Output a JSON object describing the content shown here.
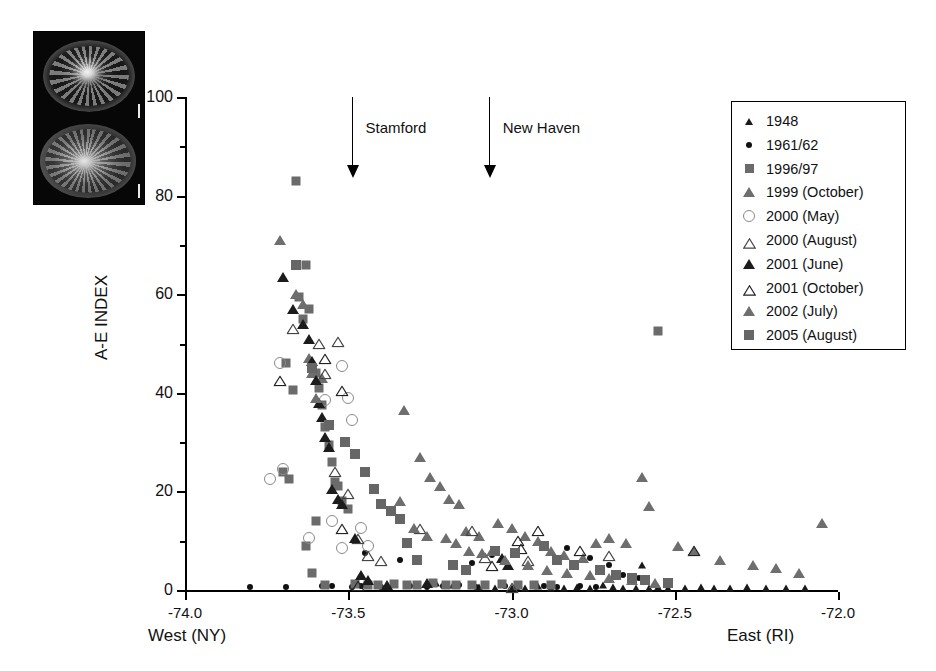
{
  "figure": {
    "photo_inset": {
      "name": "micrograph-inset",
      "panels": [
        "otolith-section-top",
        "otolith-section-bottom"
      ]
    }
  },
  "chart_data": {
    "type": "scatter",
    "title": "",
    "xlabel": "",
    "ylabel": "A-E INDEX",
    "xlim": [
      -74.0,
      -72.0
    ],
    "ylim": [
      0,
      100
    ],
    "grid": false,
    "legend_position": "top-right",
    "xticks": [
      "-74.0",
      "-73.5",
      "-73.0",
      "-72.5",
      "-72.0"
    ],
    "xtick_values": [
      -74.0,
      -73.5,
      -73.0,
      -72.5,
      -72.0
    ],
    "yticks": [
      "0",
      "20",
      "40",
      "60",
      "80",
      "100"
    ],
    "ytick_values": [
      0,
      20,
      40,
      60,
      80,
      100
    ],
    "yminor_values": [
      10,
      30,
      50,
      70,
      90
    ],
    "axis_end_labels": {
      "left": "West (NY)",
      "right": "East (RI)"
    },
    "annotations": [
      {
        "label": "Stamford",
        "x": -73.49,
        "y_top": 100,
        "y_tip": 84
      },
      {
        "label": "New Haven",
        "x": -73.07,
        "y_top": 100,
        "y_tip": 84
      }
    ],
    "series": [
      {
        "name": "1948",
        "marker": "triangle-filled-small",
        "color": "#1a1a1a",
        "points": [
          [
            -73.1,
            0.6
          ],
          [
            -73.05,
            0.5
          ],
          [
            -73.0,
            0.4
          ],
          [
            -72.96,
            0.5
          ],
          [
            -72.92,
            0.8
          ],
          [
            -72.88,
            0.5
          ],
          [
            -72.84,
            0.4
          ],
          [
            -72.8,
            0.6
          ],
          [
            -72.76,
            0.5
          ],
          [
            -72.72,
            1.0
          ],
          [
            -72.69,
            0.6
          ],
          [
            -72.66,
            0.5
          ],
          [
            -72.62,
            0.4
          ],
          [
            -72.58,
            0.5
          ],
          [
            -72.55,
            0.6
          ],
          [
            -72.52,
            0.4
          ],
          [
            -72.47,
            0.5
          ],
          [
            -72.42,
            0.6
          ],
          [
            -72.38,
            0.4
          ],
          [
            -72.33,
            0.5
          ],
          [
            -72.28,
            0.6
          ],
          [
            -72.22,
            0.5
          ],
          [
            -72.16,
            0.4
          ],
          [
            -72.1,
            0.5
          ],
          [
            -72.6,
            5.0
          ],
          [
            -73.23,
            1.5
          ],
          [
            -73.18,
            1.0
          ],
          [
            -72.05,
            13.5
          ]
        ]
      },
      {
        "name": "1961/62",
        "marker": "circle-filled",
        "color": "#111111",
        "points": [
          [
            -73.8,
            0.7
          ],
          [
            -73.69,
            0.7
          ],
          [
            -73.58,
            0.8
          ],
          [
            -73.55,
            0.8
          ],
          [
            -73.49,
            0.7
          ],
          [
            -73.4,
            0.7
          ],
          [
            -73.31,
            0.8
          ],
          [
            -73.26,
            0.7
          ],
          [
            -73.21,
            0.8
          ],
          [
            -73.16,
            1.0
          ],
          [
            -73.11,
            0.7
          ],
          [
            -73.02,
            0.8
          ],
          [
            -72.98,
            0.7
          ],
          [
            -72.9,
            0.8
          ],
          [
            -72.86,
            0.7
          ],
          [
            -72.79,
            0.8
          ],
          [
            -72.74,
            0.7
          ],
          [
            -73.34,
            6.0
          ],
          [
            -73.12,
            5.5
          ],
          [
            -73.06,
            7.0
          ],
          [
            -72.83,
            8.5
          ],
          [
            -72.76,
            6.5
          ],
          [
            -72.7,
            5.0
          ],
          [
            -72.66,
            3.0
          ],
          [
            -72.61,
            2.5
          ],
          [
            -73.45,
            7.5
          ],
          [
            -73.46,
            0.8
          ]
        ]
      },
      {
        "name": "1996/97",
        "marker": "square-filled",
        "color": "#6b6b6b",
        "points": [
          [
            -73.66,
            83.0
          ],
          [
            -73.63,
            66.0
          ],
          [
            -73.65,
            59.5
          ],
          [
            -73.64,
            55.0
          ],
          [
            -73.67,
            40.5
          ],
          [
            -73.62,
            57.0
          ],
          [
            -73.69,
            46.0
          ],
          [
            -73.6,
            44.0
          ],
          [
            -73.59,
            41.0
          ],
          [
            -73.58,
            37.5
          ],
          [
            -73.57,
            33.0
          ],
          [
            -73.56,
            29.5
          ],
          [
            -73.55,
            26.0
          ],
          [
            -73.54,
            22.0
          ],
          [
            -73.53,
            21.0
          ],
          [
            -73.52,
            18.0
          ],
          [
            -73.5,
            16.5
          ],
          [
            -73.6,
            14.0
          ],
          [
            -73.68,
            22.5
          ],
          [
            -73.7,
            24.0
          ],
          [
            -73.63,
            9.0
          ],
          [
            -73.61,
            3.5
          ],
          [
            -73.57,
            1.0
          ],
          [
            -73.48,
            1.2
          ],
          [
            -73.44,
            1.0
          ],
          [
            -73.41,
            1.0
          ],
          [
            -73.36,
            1.2
          ],
          [
            -73.32,
            1.0
          ],
          [
            -73.29,
            1.0
          ],
          [
            -73.24,
            1.5
          ],
          [
            -73.2,
            1.0
          ],
          [
            -73.17,
            1.0
          ],
          [
            -73.12,
            1.0
          ],
          [
            -73.08,
            1.0
          ],
          [
            -73.03,
            1.2
          ],
          [
            -72.98,
            1.0
          ],
          [
            -72.93,
            1.0
          ],
          [
            -72.88,
            1.0
          ],
          [
            -72.55,
            52.5
          ]
        ]
      },
      {
        "name": "1999 (October)",
        "marker": "triangle-filled",
        "color": "#6e6e6e",
        "points": [
          [
            -73.71,
            71.0
          ],
          [
            -73.66,
            60.0
          ],
          [
            -73.64,
            58.0
          ],
          [
            -73.62,
            47.0
          ],
          [
            -73.61,
            44.0
          ],
          [
            -73.58,
            43.0
          ],
          [
            -73.33,
            36.5
          ],
          [
            -73.28,
            27.0
          ],
          [
            -73.25,
            23.0
          ],
          [
            -73.22,
            21.0
          ],
          [
            -73.19,
            18.5
          ],
          [
            -73.16,
            17.5
          ],
          [
            -73.14,
            12.0
          ],
          [
            -73.1,
            11.0
          ],
          [
            -73.04,
            13.5
          ],
          [
            -73.0,
            12.5
          ],
          [
            -72.96,
            11.0
          ],
          [
            -72.92,
            10.0
          ],
          [
            -72.88,
            8.0
          ],
          [
            -72.84,
            7.0
          ],
          [
            -72.78,
            6.5
          ],
          [
            -72.74,
            9.5
          ],
          [
            -72.7,
            10.5
          ],
          [
            -72.6,
            23.0
          ],
          [
            -72.58,
            17.0
          ],
          [
            -72.49,
            9.0
          ],
          [
            -72.44,
            8.0
          ],
          [
            -72.36,
            6.0
          ],
          [
            -72.26,
            5.0
          ],
          [
            -72.19,
            4.5
          ],
          [
            -72.12,
            3.5
          ],
          [
            -72.05,
            13.5
          ],
          [
            -72.65,
            9.5
          ],
          [
            -73.06,
            8.0
          ]
        ]
      },
      {
        "name": "2000 (May)",
        "marker": "circle-open",
        "color": "#8a8a8a",
        "points": [
          [
            -73.71,
            46.0
          ],
          [
            -73.74,
            22.5
          ],
          [
            -73.7,
            24.5
          ],
          [
            -73.52,
            45.5
          ],
          [
            -73.5,
            39.0
          ],
          [
            -73.49,
            34.5
          ],
          [
            -73.57,
            38.5
          ],
          [
            -73.62,
            10.5
          ],
          [
            -73.55,
            14.0
          ],
          [
            -73.52,
            8.5
          ],
          [
            -73.46,
            12.5
          ],
          [
            -73.44,
            9.0
          ]
        ]
      },
      {
        "name": "2000 (August)",
        "marker": "triangle-open",
        "color": "#444444",
        "points": [
          [
            -73.67,
            53.5
          ],
          [
            -73.59,
            50.5
          ],
          [
            -73.53,
            51.0
          ],
          [
            -73.57,
            44.5
          ],
          [
            -73.54,
            24.5
          ],
          [
            -73.5,
            20.0
          ],
          [
            -73.47,
            11.0
          ],
          [
            -73.44,
            7.5
          ],
          [
            -73.4,
            6.5
          ],
          [
            -73.28,
            13.0
          ],
          [
            -73.12,
            12.5
          ],
          [
            -73.08,
            7.0
          ],
          [
            -73.0,
            1.0
          ],
          [
            -72.95,
            6.5
          ],
          [
            -72.7,
            7.5
          ]
        ]
      },
      {
        "name": "2001 (June)",
        "marker": "triangle-filled-dark",
        "color": "#1c1c1c",
        "points": [
          [
            -73.7,
            63.5
          ],
          [
            -73.67,
            57.0
          ],
          [
            -73.64,
            54.0
          ],
          [
            -73.62,
            51.0
          ],
          [
            -73.61,
            46.5
          ],
          [
            -73.6,
            42.5
          ],
          [
            -73.59,
            38.0
          ],
          [
            -73.58,
            35.0
          ],
          [
            -73.57,
            31.0
          ],
          [
            -73.56,
            29.0
          ],
          [
            -73.55,
            20.5
          ],
          [
            -73.53,
            18.5
          ],
          [
            -73.52,
            17.5
          ],
          [
            -73.48,
            10.5
          ],
          [
            -73.46,
            3.0
          ],
          [
            -73.44,
            2.0
          ],
          [
            -73.38,
            1.0
          ],
          [
            -73.26,
            1.5
          ],
          [
            -73.03,
            6.5
          ],
          [
            -73.01,
            5.0
          ]
        ]
      },
      {
        "name": "2001 (October)",
        "marker": "triangle-open-dark",
        "color": "#222222",
        "points": [
          [
            -73.71,
            43.0
          ],
          [
            -73.57,
            47.5
          ],
          [
            -73.52,
            41.0
          ],
          [
            -73.52,
            13.0
          ],
          [
            -73.47,
            1.5
          ],
          [
            -73.06,
            5.5
          ],
          [
            -72.98,
            10.5
          ],
          [
            -72.97,
            9.0
          ],
          [
            -72.92,
            12.5
          ],
          [
            -72.79,
            8.5
          ],
          [
            -72.44,
            8.5
          ]
        ]
      },
      {
        "name": "2002 (July)",
        "marker": "triangle-filled-med",
        "color": "#6e6e6e",
        "points": [
          [
            -73.6,
            39.0
          ],
          [
            -73.34,
            18.0
          ],
          [
            -73.3,
            12.5
          ],
          [
            -73.26,
            11.0
          ],
          [
            -73.2,
            10.5
          ],
          [
            -73.17,
            9.5
          ],
          [
            -73.13,
            8.0
          ],
          [
            -73.09,
            7.5
          ],
          [
            -73.02,
            6.0
          ],
          [
            -72.95,
            5.0
          ],
          [
            -72.89,
            4.0
          ],
          [
            -72.83,
            3.5
          ],
          [
            -72.76,
            3.0
          ],
          [
            -72.7,
            2.5
          ],
          [
            -72.63,
            2.0
          ],
          [
            -72.56,
            1.5
          ]
        ]
      },
      {
        "name": "2005 (August)",
        "marker": "square-filled-large",
        "color": "#666666",
        "points": [
          [
            -73.66,
            66.0
          ],
          [
            -73.61,
            45.0
          ],
          [
            -73.56,
            33.5
          ],
          [
            -73.51,
            30.0
          ],
          [
            -73.48,
            27.5
          ],
          [
            -73.45,
            24.0
          ],
          [
            -73.42,
            20.5
          ],
          [
            -73.4,
            17.5
          ],
          [
            -73.37,
            16.0
          ],
          [
            -73.34,
            14.5
          ],
          [
            -73.32,
            9.5
          ],
          [
            -73.29,
            6.0
          ],
          [
            -73.18,
            5.0
          ],
          [
            -73.14,
            4.0
          ],
          [
            -73.05,
            8.0
          ],
          [
            -72.99,
            7.5
          ],
          [
            -72.9,
            9.0
          ],
          [
            -72.86,
            6.0
          ],
          [
            -72.81,
            5.0
          ],
          [
            -72.73,
            4.0
          ],
          [
            -72.68,
            3.0
          ],
          [
            -72.63,
            2.5
          ],
          [
            -72.59,
            2.0
          ],
          [
            -72.52,
            1.5
          ]
        ]
      }
    ]
  },
  "legend": {
    "entries": [
      {
        "label": "1948",
        "marker": "triangle-filled-small",
        "color": "#1a1a1a"
      },
      {
        "label": "1961/62",
        "marker": "circle-filled",
        "color": "#111111"
      },
      {
        "label": "1996/97",
        "marker": "square-filled",
        "color": "#6b6b6b"
      },
      {
        "label": "1999 (October)",
        "marker": "triangle-filled",
        "color": "#6e6e6e"
      },
      {
        "label": "2000 (May)",
        "marker": "circle-open",
        "color": "#8a8a8a"
      },
      {
        "label": "2000 (August)",
        "marker": "triangle-open",
        "color": "#444444"
      },
      {
        "label": "2001 (June)",
        "marker": "triangle-filled-dark",
        "color": "#1c1c1c"
      },
      {
        "label": "2001 (October)",
        "marker": "triangle-open-dark",
        "color": "#222222"
      },
      {
        "label": "2002 (July)",
        "marker": "triangle-filled-med",
        "color": "#6e6e6e"
      },
      {
        "label": "2005 (August)",
        "marker": "square-filled-large",
        "color": "#666666"
      }
    ]
  }
}
